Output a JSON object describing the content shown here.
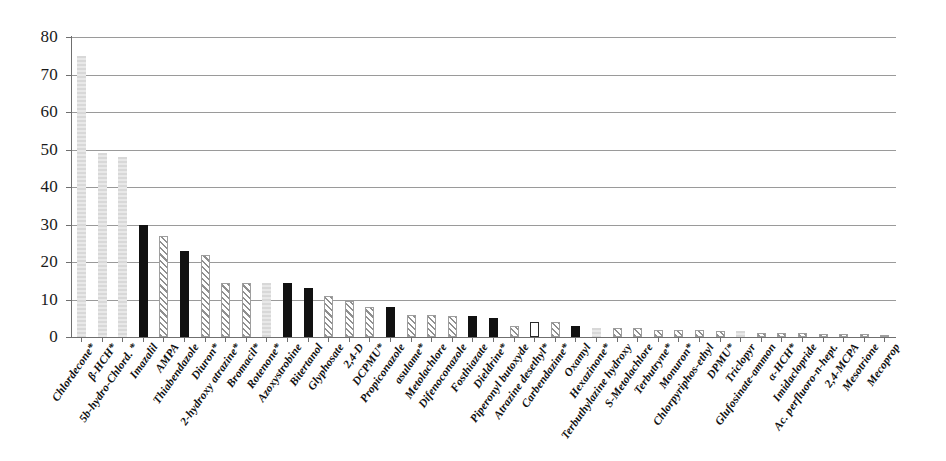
{
  "chart_data": {
    "type": "bar",
    "title": "",
    "xlabel": "",
    "ylabel": "",
    "ylim": [
      0,
      80
    ],
    "ytick_step": 10,
    "yticks": [
      0,
      10,
      20,
      30,
      40,
      50,
      60,
      70,
      80
    ],
    "grid": "horizontal",
    "legend": "none",
    "categories": [
      "Chlordecone*",
      "β-HCH*",
      "5b-hydro-Chlord. *",
      "Imazalil",
      "AMPA",
      "Thiabendazole",
      "Diuron*",
      "2-hydroxy atrazine*",
      "Bromacil*",
      "Rotenone*",
      "Azoxystrobine",
      "Bitertanol",
      "Glyphosate",
      "2,4-D",
      "DCPMU*",
      "Propiconazole",
      "asulame*",
      "Metolachlore",
      "Difenoconazole",
      "Fosthiazate",
      "Dieldrine*",
      "Piperonyl butoxyde",
      "Atrazine desethyl*",
      "Carbendazime*",
      "Oxamyl",
      "Hexazinone*",
      "Terbuthylazine hydroxy",
      "S-Metolachlore",
      "Terbutryne*",
      "Monuron*",
      "Chlorpyriphos-ethyl",
      "DPMU*",
      "Triclopyr",
      "Glufosinate-ammon",
      "α-HCH*",
      "Imidaclopride",
      "Ac. perfluoro-n-hept.",
      "2,4-MCPA",
      "Mesotrione",
      "Mecoprop"
    ],
    "values": [
      75,
      49,
      48,
      30,
      27,
      23,
      22,
      14.5,
      14.5,
      14.5,
      14.5,
      13,
      11,
      9.5,
      8,
      8,
      6,
      6,
      5.5,
      5.5,
      5,
      3,
      4,
      4,
      3,
      2.5,
      2.5,
      2.5,
      2,
      2,
      2,
      1.5,
      1.5,
      1,
      1,
      1,
      0.8,
      0.8,
      0.8,
      0.6
    ],
    "bar_styles": [
      "lightgray",
      "lightgray",
      "lightgray",
      "black",
      "hatch",
      "black",
      "hatch",
      "hatch",
      "hatch",
      "lightgray",
      "black",
      "black",
      "hatch",
      "hatch",
      "hatch",
      "black",
      "hatch",
      "hatch",
      "hatch",
      "black",
      "black",
      "hatch",
      "white",
      "hatch",
      "black",
      "lightgray",
      "hatch",
      "hatch",
      "hatch",
      "hatch",
      "hatch",
      "hatch",
      "lightgray",
      "hatch",
      "hatch",
      "hatch",
      "hatch",
      "hatch",
      "hatch",
      "hatch"
    ],
    "style_colors": {
      "black": "#111111",
      "lightgray": "#dcdcdc",
      "hatch": "#8f8f8f",
      "white": "#ffffff"
    },
    "axis_color": "#6f6f6f",
    "grid_color": "#9a9a9a"
  }
}
